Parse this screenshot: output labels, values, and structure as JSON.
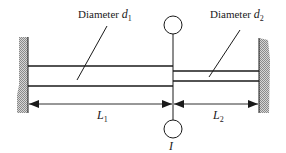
{
  "diagram": {
    "type": "stepped-shaft-torsion",
    "labels": {
      "diameter_1": {
        "prefix": "Diameter ",
        "symbol": "d",
        "subscript": "1"
      },
      "diameter_2": {
        "prefix": "Diameter ",
        "symbol": "d",
        "subscript": "2"
      },
      "length_1": {
        "symbol": "L",
        "subscript": "1"
      },
      "length_2": {
        "symbol": "L",
        "subscript": "2"
      },
      "inertia": {
        "symbol": "I"
      }
    },
    "colors": {
      "line": "#1a1a1a",
      "wall_hatch": "#9a9a9a",
      "background": "#ffffff"
    }
  }
}
